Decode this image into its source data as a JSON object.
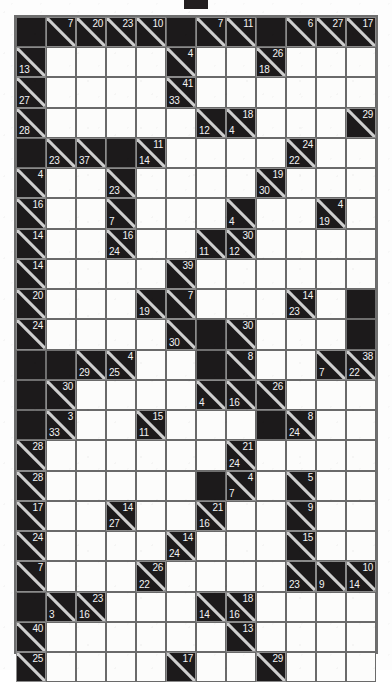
{
  "puzzle": {
    "type": "kakuro",
    "title": "Kakuro Puzzle Grid",
    "columns": 12,
    "rows": 21,
    "cell_size": 30.3,
    "colors": {
      "block": "#1c1a1b",
      "white": "#fcfcfb",
      "gridline": "#6a6a6a",
      "clue_text": "#f3f3f3",
      "page_background": "#fdfdfd"
    },
    "top_marker": {
      "name": "top-marker",
      "color": "#231f20"
    },
    "legend": {
      "down_clue": "number in upper-right triangle is the sum of the vertical run below",
      "across_clue": "number in lower-left triangle is the sum of the horizontal run to the right"
    }
  },
  "chart_data": {
    "type": "table",
    "rows": 21,
    "cols": 12,
    "cells": [
      [
        {
          "t": "b"
        },
        {
          "t": "c",
          "d": 7
        },
        {
          "t": "c",
          "d": 20
        },
        {
          "t": "c",
          "d": 23
        },
        {
          "t": "c",
          "d": 10
        },
        {
          "t": "b"
        },
        {
          "t": "c",
          "d": 7
        },
        {
          "t": "c",
          "d": 11
        },
        {
          "t": "b"
        },
        {
          "t": "c",
          "d": 6
        },
        {
          "t": "c",
          "d": 27
        },
        {
          "t": "c",
          "d": 17
        }
      ],
      [
        {
          "t": "c",
          "a": 13
        },
        {
          "t": "w"
        },
        {
          "t": "w"
        },
        {
          "t": "w"
        },
        {
          "t": "w"
        },
        {
          "t": "c",
          "d": 4
        },
        {
          "t": "w"
        },
        {
          "t": "w"
        },
        {
          "t": "c",
          "d": 26,
          "a": 18
        },
        {
          "t": "w"
        },
        {
          "t": "w"
        },
        {
          "t": "w"
        }
      ],
      [
        {
          "t": "c",
          "a": 27
        },
        {
          "t": "w"
        },
        {
          "t": "w"
        },
        {
          "t": "w"
        },
        {
          "t": "w"
        },
        {
          "t": "c",
          "d": 41,
          "a": 33
        },
        {
          "t": "w"
        },
        {
          "t": "w"
        },
        {
          "t": "w"
        },
        {
          "t": "w"
        },
        {
          "t": "w"
        },
        {
          "t": "w"
        }
      ],
      [
        {
          "t": "c",
          "a": 28
        },
        {
          "t": "w"
        },
        {
          "t": "w"
        },
        {
          "t": "w"
        },
        {
          "t": "w"
        },
        {
          "t": "w"
        },
        {
          "t": "c",
          "a": 12
        },
        {
          "t": "c",
          "d": 18,
          "a": 4
        },
        {
          "t": "w"
        },
        {
          "t": "w"
        },
        {
          "t": "w"
        },
        {
          "t": "c",
          "d": 29
        }
      ],
      [
        {
          "t": "b"
        },
        {
          "t": "c",
          "a": 23
        },
        {
          "t": "c",
          "a": 37
        },
        {
          "t": "b"
        },
        {
          "t": "c",
          "d": 11,
          "a": 14
        },
        {
          "t": "w"
        },
        {
          "t": "w"
        },
        {
          "t": "w"
        },
        {
          "t": "w"
        },
        {
          "t": "c",
          "d": 24,
          "a": 22
        },
        {
          "t": "w"
        },
        {
          "t": "w"
        }
      ],
      [
        {
          "t": "c",
          "d": 4
        },
        {
          "t": "w"
        },
        {
          "t": "w"
        },
        {
          "t": "c",
          "a": 23
        },
        {
          "t": "w"
        },
        {
          "t": "w"
        },
        {
          "t": "w"
        },
        {
          "t": "w"
        },
        {
          "t": "c",
          "d": 19,
          "a": 30
        },
        {
          "t": "w"
        },
        {
          "t": "w"
        },
        {
          "t": "w"
        }
      ],
      [
        {
          "t": "c",
          "d": 16
        },
        {
          "t": "w"
        },
        {
          "t": "w"
        },
        {
          "t": "c",
          "a": 7
        },
        {
          "t": "w"
        },
        {
          "t": "w"
        },
        {
          "t": "w"
        },
        {
          "t": "c",
          "a": 4
        },
        {
          "t": "w"
        },
        {
          "t": "w"
        },
        {
          "t": "c",
          "d": 4,
          "a": 19
        },
        {
          "t": "w"
        }
      ],
      [
        {
          "t": "c",
          "d": 14
        },
        {
          "t": "w"
        },
        {
          "t": "w"
        },
        {
          "t": "c",
          "d": 16,
          "a": 24
        },
        {
          "t": "w"
        },
        {
          "t": "w"
        },
        {
          "t": "c",
          "a": 11
        },
        {
          "t": "c",
          "d": 30,
          "a": 12
        },
        {
          "t": "w"
        },
        {
          "t": "w"
        },
        {
          "t": "w"
        },
        {
          "t": "w"
        }
      ],
      [
        {
          "t": "c",
          "d": 14
        },
        {
          "t": "w"
        },
        {
          "t": "w"
        },
        {
          "t": "w"
        },
        {
          "t": "w"
        },
        {
          "t": "c",
          "d": 39
        },
        {
          "t": "w"
        },
        {
          "t": "w"
        },
        {
          "t": "w"
        },
        {
          "t": "w"
        },
        {
          "t": "w"
        },
        {
          "t": "w"
        }
      ],
      [
        {
          "t": "c",
          "d": 20
        },
        {
          "t": "w"
        },
        {
          "t": "w"
        },
        {
          "t": "w"
        },
        {
          "t": "c",
          "a": 19
        },
        {
          "t": "c",
          "d": 7
        },
        {
          "t": "w"
        },
        {
          "t": "w"
        },
        {
          "t": "w"
        },
        {
          "t": "c",
          "d": 14,
          "a": 23
        },
        {
          "t": "w"
        },
        {
          "t": "b"
        }
      ],
      [
        {
          "t": "c",
          "d": 24
        },
        {
          "t": "w"
        },
        {
          "t": "w"
        },
        {
          "t": "w"
        },
        {
          "t": "w"
        },
        {
          "t": "c",
          "a": 30
        },
        {
          "t": "b"
        },
        {
          "t": "c",
          "d": 30
        },
        {
          "t": "w"
        },
        {
          "t": "w"
        },
        {
          "t": "w"
        },
        {
          "t": "b"
        }
      ],
      [
        {
          "t": "b"
        },
        {
          "t": "b"
        },
        {
          "t": "c",
          "a": 29
        },
        {
          "t": "c",
          "d": 4,
          "a": 25
        },
        {
          "t": "w"
        },
        {
          "t": "w"
        },
        {
          "t": "b"
        },
        {
          "t": "c",
          "d": 8
        },
        {
          "t": "w"
        },
        {
          "t": "w"
        },
        {
          "t": "c",
          "a": 7
        },
        {
          "t": "c",
          "d": 38,
          "a": 22
        }
      ],
      [
        {
          "t": "b"
        },
        {
          "t": "c",
          "d": 30
        },
        {
          "t": "w"
        },
        {
          "t": "w"
        },
        {
          "t": "w"
        },
        {
          "t": "w"
        },
        {
          "t": "c",
          "a": 4
        },
        {
          "t": "c",
          "a": 16
        },
        {
          "t": "c",
          "d": 26
        },
        {
          "t": "w"
        },
        {
          "t": "w"
        },
        {
          "t": "w"
        }
      ],
      [
        {
          "t": "b"
        },
        {
          "t": "c",
          "d": 3,
          "a": 33
        },
        {
          "t": "w"
        },
        {
          "t": "w"
        },
        {
          "t": "c",
          "d": 15,
          "a": 11
        },
        {
          "t": "w"
        },
        {
          "t": "w"
        },
        {
          "t": "w"
        },
        {
          "t": "b"
        },
        {
          "t": "c",
          "d": 8,
          "a": 24
        },
        {
          "t": "w"
        },
        {
          "t": "w"
        }
      ],
      [
        {
          "t": "c",
          "d": 28
        },
        {
          "t": "w"
        },
        {
          "t": "w"
        },
        {
          "t": "w"
        },
        {
          "t": "w"
        },
        {
          "t": "w"
        },
        {
          "t": "w"
        },
        {
          "t": "c",
          "d": 21,
          "a": 24
        },
        {
          "t": "w"
        },
        {
          "t": "w"
        },
        {
          "t": "w"
        },
        {
          "t": "w"
        }
      ],
      [
        {
          "t": "c",
          "d": 28
        },
        {
          "t": "w"
        },
        {
          "t": "w"
        },
        {
          "t": "w"
        },
        {
          "t": "w"
        },
        {
          "t": "w"
        },
        {
          "t": "b"
        },
        {
          "t": "c",
          "d": 4,
          "a": 7
        },
        {
          "t": "w"
        },
        {
          "t": "c",
          "d": 5
        },
        {
          "t": "w"
        },
        {
          "t": "w"
        }
      ],
      [
        {
          "t": "c",
          "d": 17
        },
        {
          "t": "w"
        },
        {
          "t": "w"
        },
        {
          "t": "c",
          "d": 14,
          "a": 27
        },
        {
          "t": "w"
        },
        {
          "t": "w"
        },
        {
          "t": "c",
          "d": 21,
          "a": 16
        },
        {
          "t": "w"
        },
        {
          "t": "w"
        },
        {
          "t": "c",
          "d": 9
        },
        {
          "t": "w"
        },
        {
          "t": "w"
        }
      ],
      [
        {
          "t": "c",
          "d": 24
        },
        {
          "t": "w"
        },
        {
          "t": "w"
        },
        {
          "t": "w"
        },
        {
          "t": "w"
        },
        {
          "t": "c",
          "d": 14,
          "a": 24
        },
        {
          "t": "w"
        },
        {
          "t": "w"
        },
        {
          "t": "w"
        },
        {
          "t": "c",
          "d": 15
        },
        {
          "t": "w"
        },
        {
          "t": "w"
        }
      ],
      [
        {
          "t": "c",
          "d": 7
        },
        {
          "t": "w"
        },
        {
          "t": "w"
        },
        {
          "t": "w"
        },
        {
          "t": "c",
          "d": 26,
          "a": 22
        },
        {
          "t": "w"
        },
        {
          "t": "w"
        },
        {
          "t": "w"
        },
        {
          "t": "w"
        },
        {
          "t": "c",
          "a": 23
        },
        {
          "t": "c",
          "a": 9
        },
        {
          "t": "c",
          "d": 10,
          "a": 14
        }
      ],
      [
        {
          "t": "b"
        },
        {
          "t": "c",
          "a": 3
        },
        {
          "t": "c",
          "d": 23,
          "a": 16
        },
        {
          "t": "w"
        },
        {
          "t": "w"
        },
        {
          "t": "w"
        },
        {
          "t": "c",
          "a": 14
        },
        {
          "t": "c",
          "d": 18,
          "a": 16
        },
        {
          "t": "w"
        },
        {
          "t": "w"
        },
        {
          "t": "w"
        },
        {
          "t": "w"
        }
      ],
      [
        {
          "t": "c",
          "d": 40
        },
        {
          "t": "w"
        },
        {
          "t": "w"
        },
        {
          "t": "w"
        },
        {
          "t": "w"
        },
        {
          "t": "w"
        },
        {
          "t": "w"
        },
        {
          "t": "c",
          "d": 13
        },
        {
          "t": "w"
        },
        {
          "t": "w"
        },
        {
          "t": "w"
        },
        {
          "t": "w"
        }
      ],
      [
        {
          "t": "c",
          "d": 25
        },
        {
          "t": "w"
        },
        {
          "t": "w"
        },
        {
          "t": "w"
        },
        {
          "t": "w"
        },
        {
          "t": "c",
          "d": 17
        },
        {
          "t": "w"
        },
        {
          "t": "w"
        },
        {
          "t": "c",
          "d": 29
        },
        {
          "t": "w"
        },
        {
          "t": "w"
        },
        {
          "t": "w"
        }
      ]
    ]
  }
}
